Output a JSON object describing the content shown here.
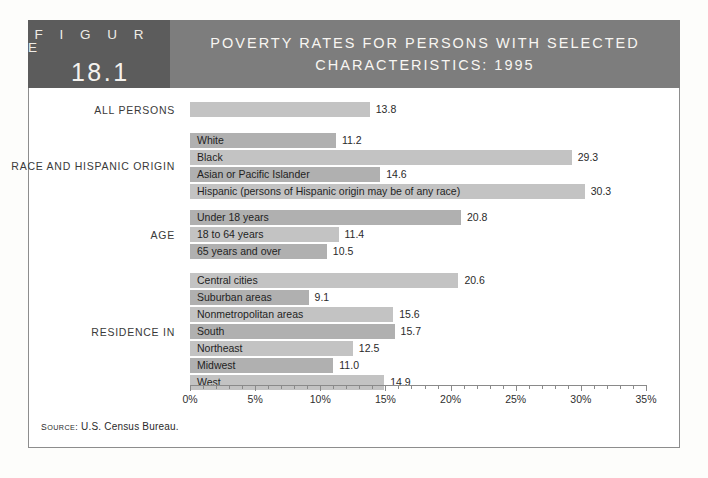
{
  "figure": {
    "word": "F I G U R E",
    "number": "18.1",
    "title": "POVERTY RATES FOR PERSONS WITH SELECTED CHARACTERISTICS: 1995"
  },
  "source": {
    "label_caps": "S",
    "label_rest": "OURCE",
    "text": "SOURCE: U.S. Census Bureau.",
    "prefix_small": "OURCE:",
    "prefix_big": "S",
    "body": " U.S. Census Bureau."
  },
  "chart_data": {
    "type": "bar",
    "orientation": "horizontal",
    "title": "POVERTY RATES FOR PERSONS WITH SELECTED CHARACTERISTICS: 1995",
    "xlabel": "",
    "ylabel": "",
    "xlim": [
      0,
      35
    ],
    "xunit": "%",
    "grid": false,
    "legend": false,
    "tick_labels": [
      "0%",
      "5%",
      "10%",
      "15%",
      "20%",
      "25%",
      "30%",
      "35%"
    ],
    "tick_values": [
      0,
      5,
      10,
      15,
      20,
      25,
      30,
      35
    ],
    "minor_tick_step": 1,
    "source": "SOURCE: U.S. Census Bureau.",
    "groups": [
      {
        "name": "ALL PERSONS",
        "bars": [
          {
            "label": "",
            "value": 13.8,
            "value_text": "13.8"
          }
        ]
      },
      {
        "name": "RACE AND HISPANIC ORIGIN",
        "bars": [
          {
            "label": "White",
            "value": 11.2,
            "value_text": "11.2"
          },
          {
            "label": "Black",
            "value": 29.3,
            "value_text": "29.3"
          },
          {
            "label": "Asian or Pacific Islander",
            "value": 14.6,
            "value_text": "14.6"
          },
          {
            "label": "Hispanic (persons of Hispanic origin may be of any race)",
            "value": 30.3,
            "value_text": "30.3"
          }
        ]
      },
      {
        "name": "AGE",
        "bars": [
          {
            "label": "Under 18 years",
            "value": 20.8,
            "value_text": "20.8"
          },
          {
            "label": "18 to 64 years",
            "value": 11.4,
            "value_text": "11.4"
          },
          {
            "label": "65 years and over",
            "value": 10.5,
            "value_text": "10.5"
          }
        ]
      },
      {
        "name": "RESIDENCE IN",
        "bars": [
          {
            "label": "Central cities",
            "value": 20.6,
            "value_text": "20.6"
          },
          {
            "label": "Suburban areas",
            "value": 9.1,
            "value_text": "9.1"
          },
          {
            "label": "Nonmetropolitan areas",
            "value": 15.6,
            "value_text": "15.6"
          },
          {
            "label": "South",
            "value": 15.7,
            "value_text": "15.7"
          },
          {
            "label": "Northeast",
            "value": 12.5,
            "value_text": "12.5"
          },
          {
            "label": "Midwest",
            "value": 11.0,
            "value_text": "11.0"
          },
          {
            "label": "West",
            "value": 14.9,
            "value_text": "14.9"
          }
        ]
      }
    ]
  },
  "colors": {
    "badge_bg": "#5c5c5c",
    "title_bg": "#7d7d7d",
    "bar_light": "#c3c3c3",
    "bar_dark": "#b0b0b0",
    "frame_border": "#8d8d8d",
    "text": "#1f1f1f"
  }
}
